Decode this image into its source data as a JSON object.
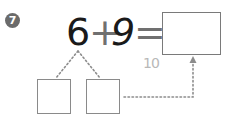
{
  "problem": {
    "number": "7",
    "left_operand": "6",
    "operator": "+",
    "right_operand": "9",
    "equals": "=",
    "answer": "",
    "hint": "10",
    "decomposition": {
      "left_part": "",
      "right_part": ""
    }
  },
  "colors": {
    "badge": "#6b6b6b",
    "text": "#1a1a1a",
    "operator": "#707070",
    "box_border": "#7a7a7a",
    "dotted": "#8c8c8c",
    "hint": "#b8b8b8"
  }
}
